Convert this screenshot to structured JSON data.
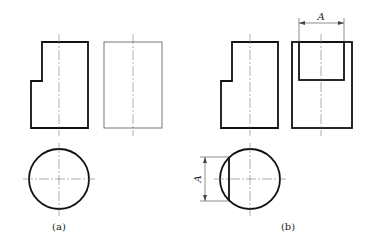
{
  "figure": {
    "panels": [
      {
        "id": "a",
        "caption": "(a)"
      },
      {
        "id": "b",
        "caption": "(b)"
      }
    ],
    "dimension_label_top": "A",
    "dimension_label_left": "A"
  }
}
